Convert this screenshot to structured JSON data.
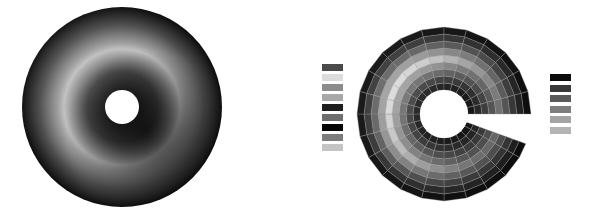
{
  "figure": {
    "left_panel": {
      "type": "smooth-shaded-annulus",
      "center": [
        122,
        107
      ],
      "outer_radius": 100,
      "inner_radius": 14,
      "shading": "grayscale, bright ring at mid radius, dark lower-right near hole"
    },
    "right_panel": {
      "type": "segmented-annulus-with-wedge-cut",
      "center": [
        444,
        114
      ],
      "outer_radius": 88,
      "inner_radius": 24,
      "rings": 9,
      "sectors": 24,
      "gap_angle_deg": [
        -3,
        18
      ]
    },
    "legend_left": {
      "swatches": [
        "#4a4a4a",
        "#dcdcdc",
        "#8c8c8c",
        "#a8a8a8",
        "#1e1e1e",
        "#6e6e6e",
        "#050505",
        "#7c7c7c",
        "#c4c4c4"
      ]
    },
    "legend_right": {
      "swatches": [
        "#0c0c0c",
        "#3a3a3a",
        "#5a5a5a",
        "#7e7e7e",
        "#a4a4a4",
        "#b4b4b4"
      ]
    }
  }
}
